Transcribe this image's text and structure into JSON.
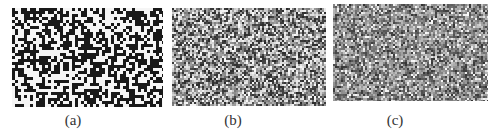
{
  "figure": {
    "panels": [
      {
        "id": "a",
        "label": "(a)",
        "description": "binary black/white random pixel pattern",
        "mode": "binary",
        "rect": {
          "x": 12,
          "y": 8,
          "w": 151,
          "h": 99
        },
        "cell": 3,
        "label_pos": {
          "x": 58,
          "y": 112
        },
        "seed": 11
      },
      {
        "id": "b",
        "label": "(b)",
        "description": "gray-level random pixel pattern, medium contrast",
        "mode": "gray-high",
        "rect": {
          "x": 172,
          "y": 8,
          "w": 154,
          "h": 98
        },
        "cell": 2,
        "label_pos": {
          "x": 218,
          "y": 112
        },
        "seed": 23
      },
      {
        "id": "c",
        "label": "(c)",
        "description": "gray-level random pixel pattern, low contrast",
        "mode": "gray-low",
        "rect": {
          "x": 333,
          "y": 4,
          "w": 155,
          "h": 97
        },
        "cell": 2,
        "label_pos": {
          "x": 380,
          "y": 112
        },
        "seed": 37
      }
    ],
    "colors": {
      "background": "#ffffff",
      "dark": "#1a1a1a",
      "light": "#f4f4f4",
      "caption": "#333333"
    }
  }
}
